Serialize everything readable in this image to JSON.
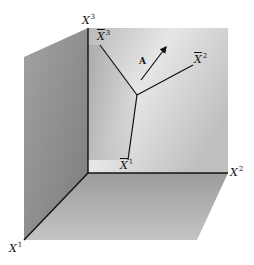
{
  "figure": {
    "colors": {
      "background": "#ffffff",
      "back_wall": "#c8c8c8",
      "back_wall_light": "#e4e4e4",
      "left_wall": "#8f8f8f",
      "floor": "#a9a9a9",
      "lines": "#111111"
    },
    "axes": {
      "x1": {
        "base": "X",
        "sup": "1"
      },
      "x2": {
        "base": "X",
        "sup": "2"
      },
      "x3": {
        "base": "X",
        "sup": "3"
      }
    },
    "bar_axes": {
      "xbar1": {
        "base": "X",
        "sup": "1"
      },
      "xbar2": {
        "base": "X",
        "sup": "2"
      },
      "xbar3": {
        "base": "X",
        "sup": "3"
      }
    },
    "vector": {
      "label": "A"
    }
  }
}
